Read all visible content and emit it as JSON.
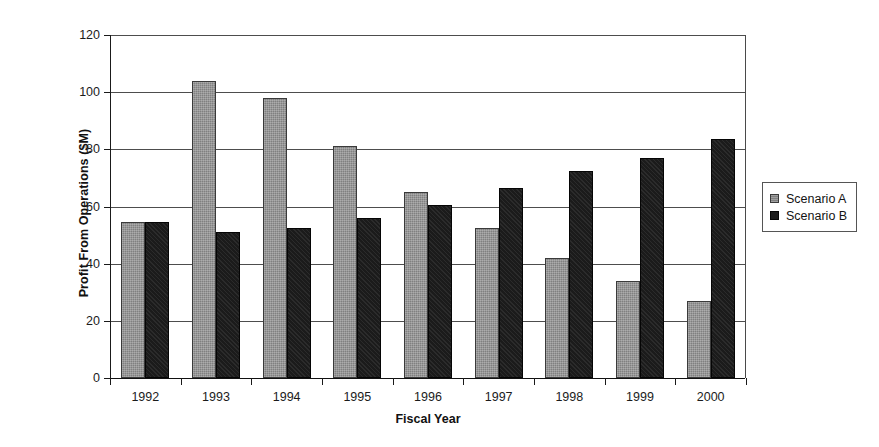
{
  "chart_data": {
    "type": "bar",
    "title": "",
    "xlabel": "Fiscal Year",
    "ylabel": "Profit From Operations ($M)",
    "categories": [
      "1992",
      "1993",
      "1994",
      "1995",
      "1996",
      "1997",
      "1998",
      "1999",
      "2000"
    ],
    "series": [
      {
        "name": "Scenario A",
        "color": "#808080",
        "values": [
          54.5,
          104,
          98,
          81,
          65,
          52.5,
          42,
          34,
          27
        ]
      },
      {
        "name": "Scenario B",
        "color": "#1b1b1b",
        "values": [
          54.5,
          51,
          52.5,
          56,
          60.5,
          66.5,
          72.5,
          77,
          83.5
        ]
      }
    ],
    "ylim": [
      0,
      120
    ],
    "yticks": [
      0,
      20,
      40,
      60,
      80,
      100,
      120
    ],
    "ytick_labels": [
      "0",
      "20",
      "40",
      "60",
      "80",
      "100",
      "120"
    ],
    "grid": true,
    "legend_position": "right"
  },
  "legend": {
    "entries": [
      {
        "label": "Scenario A",
        "swatch": "series-a-swatch"
      },
      {
        "label": "Scenario B",
        "swatch": "series-b-swatch"
      }
    ]
  }
}
